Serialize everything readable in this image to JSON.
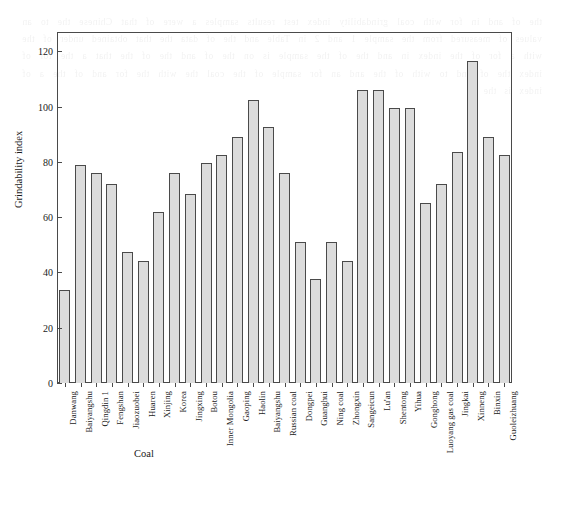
{
  "chart_data": {
    "type": "bar",
    "title": "",
    "xlabel": "Coal",
    "ylabel": "Grindability index",
    "categories": [
      "Danwang",
      "Baiyangshu",
      "Qingdin 1",
      "Fengshan",
      "Jiaozuobei",
      "Huaren",
      "Xinjing",
      "Korea",
      "Jingxing",
      "Botou",
      "Inner Mongolia",
      "Gaoping",
      "Haolin",
      "Baiyangshu",
      "Russian coal",
      "Dongpei",
      "Guanghui",
      "Ning coal",
      "Zhongxin",
      "Sangeicun",
      "Lu'an",
      "Shentong",
      "Yihua",
      "Gonghong",
      "Luoyang gas coal",
      "Jingkai",
      "Xinneng",
      "Binxin",
      "Guoleizhuang"
    ],
    "values": [
      33.5,
      79.0,
      76.0,
      72.0,
      47.5,
      44.0,
      62.0,
      76.0,
      68.5,
      79.5,
      82.5,
      89.0,
      102.5,
      92.5,
      76.0,
      51.0,
      37.5,
      51.0,
      44.0,
      106.0,
      106.0,
      99.5,
      99.5,
      65.0,
      72.0,
      83.5,
      116.5,
      89.0,
      82.5
    ],
    "ylim": [
      0,
      127
    ],
    "yticks": [
      0,
      20,
      40,
      60,
      80,
      100,
      120
    ],
    "ytick_labels": [
      "0",
      "20",
      "40",
      "60",
      "80",
      "100",
      "120"
    ],
    "grid": false,
    "legend": "none",
    "bar_fill_color": "#dcdcdc",
    "bar_edge_color": "#4a4a4a",
    "axis_color": "#4a4a4a",
    "background_color": "#ffffff"
  },
  "page_bleed_text": "the of and in for with coal grindability index test results samples a were of that Chinese the to an values of measured from the sample 1 and 2 in Table and the of data the that obtained under of the with a for of the index in and the of the sample is on the of and the of the that a the for of index the of and to with of the and an for sample of the coal the with the for and of the a of index is the"
}
